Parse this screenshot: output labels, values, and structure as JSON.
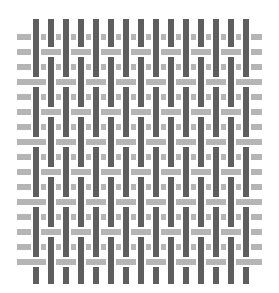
{
  "image": {
    "title": "Woven basket-weave pattern",
    "colors": {
      "background": "#ffffff",
      "warp": "#5e5e5e",
      "weft": "#b5b5b5"
    },
    "grid": {
      "columns": 15,
      "rows": 16,
      "col_start_x": 33,
      "row_start_y": 37,
      "spacing": 15,
      "warp_width": 6,
      "weft_height": 6,
      "top_y": 19,
      "bottom_y": 284,
      "left_x": 17,
      "right_x": 262
    }
  }
}
